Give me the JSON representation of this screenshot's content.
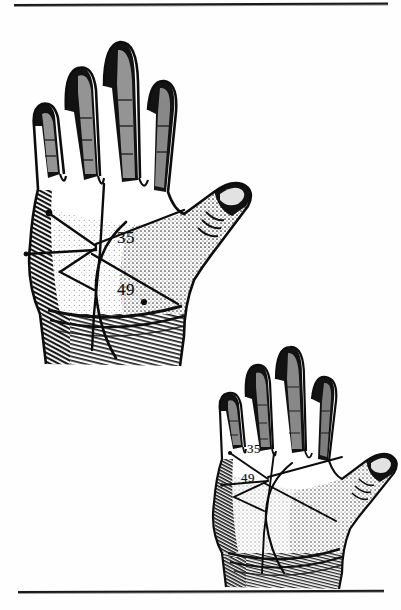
{
  "page": {
    "kind": "scanned-book-plate",
    "background_color": "#fefefe",
    "ink_color": "#111111",
    "width": 401,
    "height": 610
  },
  "rules": {
    "top": {
      "name": "top-rule",
      "color": "#1a1a1a"
    },
    "bottom": {
      "name": "bottom-rule",
      "color": "#1a1a1a"
    }
  },
  "figures": [
    {
      "id": "large-hand",
      "description": "engraved left palm, fingers up, thumb to the right",
      "markings": [
        {
          "label": "35",
          "meaning": "upper palm marking"
        },
        {
          "label": "49",
          "meaning": "lower palm marking"
        }
      ]
    },
    {
      "id": "small-hand",
      "description": "smaller engraved palm, same markings",
      "markings": [
        {
          "label": "35",
          "meaning": "upper palm marking"
        },
        {
          "label": "49",
          "meaning": "lower palm marking"
        }
      ]
    }
  ],
  "labels": {
    "large_35": "35",
    "large_49": "49",
    "small_35": "35",
    "small_49": "49"
  },
  "caption": ""
}
